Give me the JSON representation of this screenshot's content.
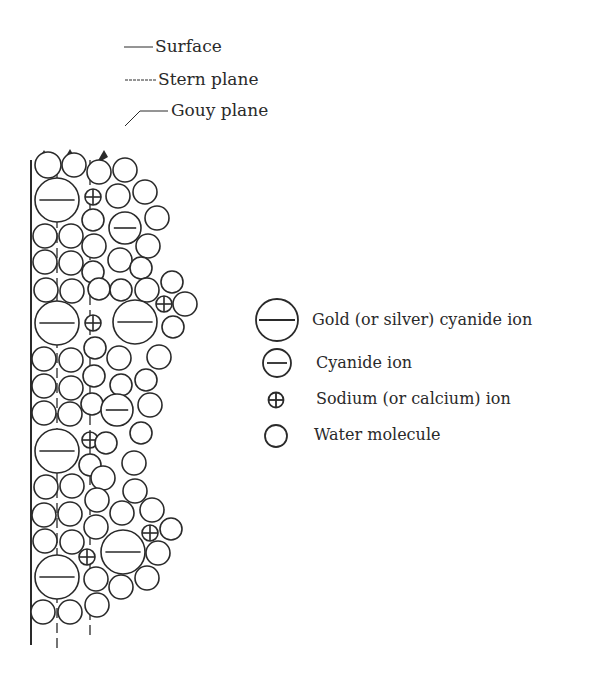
{
  "labels": {
    "surface": "Surface",
    "stern": "Stern plane",
    "gouy": "Gouy plane"
  },
  "legend": {
    "items": [
      {
        "symbol": "large-minus-circle",
        "label": "Gold (or silver) cyanide ion"
      },
      {
        "symbol": "small-minus-circle",
        "label": "Cyanide ion"
      },
      {
        "symbol": "plus-circle",
        "label": "Sodium (or calcium) ion"
      },
      {
        "symbol": "circle",
        "label": "Water molecule"
      }
    ]
  },
  "colors": {
    "stroke": "#2a2a2a",
    "background": "#ffffff"
  },
  "particles": [
    {
      "t": "w",
      "x": 48,
      "y": 165,
      "r": 13
    },
    {
      "t": "w",
      "x": 74,
      "y": 165,
      "r": 12
    },
    {
      "t": "w",
      "x": 99,
      "y": 172,
      "r": 12
    },
    {
      "t": "w",
      "x": 125,
      "y": 170,
      "r": 12
    },
    {
      "t": "L",
      "x": 57,
      "y": 200,
      "r": 22
    },
    {
      "t": "p",
      "x": 93,
      "y": 197,
      "r": 8
    },
    {
      "t": "w",
      "x": 118,
      "y": 196,
      "r": 12
    },
    {
      "t": "w",
      "x": 145,
      "y": 192,
      "r": 12
    },
    {
      "t": "w",
      "x": 93,
      "y": 220,
      "r": 11
    },
    {
      "t": "m",
      "x": 125,
      "y": 228,
      "r": 16
    },
    {
      "t": "w",
      "x": 157,
      "y": 218,
      "r": 12
    },
    {
      "t": "w",
      "x": 45,
      "y": 236,
      "r": 12
    },
    {
      "t": "w",
      "x": 71,
      "y": 236,
      "r": 12
    },
    {
      "t": "w",
      "x": 94,
      "y": 246,
      "r": 12
    },
    {
      "t": "w",
      "x": 148,
      "y": 246,
      "r": 12
    },
    {
      "t": "w",
      "x": 45,
      "y": 262,
      "r": 12
    },
    {
      "t": "w",
      "x": 71,
      "y": 263,
      "r": 12
    },
    {
      "t": "w",
      "x": 93,
      "y": 272,
      "r": 11
    },
    {
      "t": "w",
      "x": 120,
      "y": 260,
      "r": 12
    },
    {
      "t": "w",
      "x": 141,
      "y": 268,
      "r": 11
    },
    {
      "t": "w",
      "x": 46,
      "y": 290,
      "r": 12
    },
    {
      "t": "w",
      "x": 72,
      "y": 291,
      "r": 12
    },
    {
      "t": "w",
      "x": 99,
      "y": 289,
      "r": 11
    },
    {
      "t": "w",
      "x": 121,
      "y": 290,
      "r": 11
    },
    {
      "t": "w",
      "x": 147,
      "y": 290,
      "r": 12
    },
    {
      "t": "w",
      "x": 172,
      "y": 282,
      "r": 11
    },
    {
      "t": "L",
      "x": 57,
      "y": 323,
      "r": 22
    },
    {
      "t": "p",
      "x": 93,
      "y": 323,
      "r": 8
    },
    {
      "t": "L",
      "x": 135,
      "y": 322,
      "r": 22
    },
    {
      "t": "p",
      "x": 164,
      "y": 304,
      "r": 8
    },
    {
      "t": "w",
      "x": 185,
      "y": 304,
      "r": 12
    },
    {
      "t": "w",
      "x": 173,
      "y": 327,
      "r": 11
    },
    {
      "t": "w",
      "x": 44,
      "y": 359,
      "r": 12
    },
    {
      "t": "w",
      "x": 71,
      "y": 360,
      "r": 12
    },
    {
      "t": "w",
      "x": 95,
      "y": 348,
      "r": 11
    },
    {
      "t": "w",
      "x": 119,
      "y": 358,
      "r": 12
    },
    {
      "t": "w",
      "x": 159,
      "y": 357,
      "r": 12
    },
    {
      "t": "w",
      "x": 44,
      "y": 386,
      "r": 12
    },
    {
      "t": "w",
      "x": 71,
      "y": 388,
      "r": 12
    },
    {
      "t": "w",
      "x": 94,
      "y": 376,
      "r": 11
    },
    {
      "t": "w",
      "x": 121,
      "y": 385,
      "r": 11
    },
    {
      "t": "w",
      "x": 146,
      "y": 380,
      "r": 11
    },
    {
      "t": "w",
      "x": 44,
      "y": 413,
      "r": 12
    },
    {
      "t": "w",
      "x": 70,
      "y": 414,
      "r": 12
    },
    {
      "t": "w",
      "x": 92,
      "y": 404,
      "r": 11
    },
    {
      "t": "m",
      "x": 117,
      "y": 410,
      "r": 16
    },
    {
      "t": "w",
      "x": 150,
      "y": 405,
      "r": 12
    },
    {
      "t": "L",
      "x": 57,
      "y": 451,
      "r": 22
    },
    {
      "t": "p",
      "x": 90,
      "y": 440,
      "r": 8
    },
    {
      "t": "w",
      "x": 106,
      "y": 443,
      "r": 11
    },
    {
      "t": "w",
      "x": 141,
      "y": 433,
      "r": 11
    },
    {
      "t": "w",
      "x": 90,
      "y": 465,
      "r": 11
    },
    {
      "t": "w",
      "x": 134,
      "y": 463,
      "r": 12
    },
    {
      "t": "w",
      "x": 46,
      "y": 487,
      "r": 12
    },
    {
      "t": "w",
      "x": 72,
      "y": 486,
      "r": 12
    },
    {
      "t": "w",
      "x": 103,
      "y": 478,
      "r": 12
    },
    {
      "t": "w",
      "x": 135,
      "y": 491,
      "r": 12
    },
    {
      "t": "w",
      "x": 97,
      "y": 500,
      "r": 12
    },
    {
      "t": "w",
      "x": 122,
      "y": 513,
      "r": 12
    },
    {
      "t": "w",
      "x": 152,
      "y": 510,
      "r": 12
    },
    {
      "t": "w",
      "x": 44,
      "y": 515,
      "r": 12
    },
    {
      "t": "w",
      "x": 70,
      "y": 514,
      "r": 12
    },
    {
      "t": "w",
      "x": 96,
      "y": 527,
      "r": 12
    },
    {
      "t": "w",
      "x": 171,
      "y": 529,
      "r": 11
    },
    {
      "t": "w",
      "x": 45,
      "y": 541,
      "r": 12
    },
    {
      "t": "w",
      "x": 72,
      "y": 542,
      "r": 12
    },
    {
      "t": "L",
      "x": 123,
      "y": 552,
      "r": 22
    },
    {
      "t": "p",
      "x": 150,
      "y": 533,
      "r": 8
    },
    {
      "t": "w",
      "x": 158,
      "y": 553,
      "r": 12
    },
    {
      "t": "L",
      "x": 57,
      "y": 577,
      "r": 22
    },
    {
      "t": "p",
      "x": 87,
      "y": 557,
      "r": 8
    },
    {
      "t": "w",
      "x": 96,
      "y": 579,
      "r": 12
    },
    {
      "t": "w",
      "x": 121,
      "y": 587,
      "r": 12
    },
    {
      "t": "w",
      "x": 147,
      "y": 578,
      "r": 12
    },
    {
      "t": "w",
      "x": 43,
      "y": 612,
      "r": 12
    },
    {
      "t": "w",
      "x": 70,
      "y": 612,
      "r": 12
    },
    {
      "t": "w",
      "x": 97,
      "y": 605,
      "r": 12
    }
  ]
}
